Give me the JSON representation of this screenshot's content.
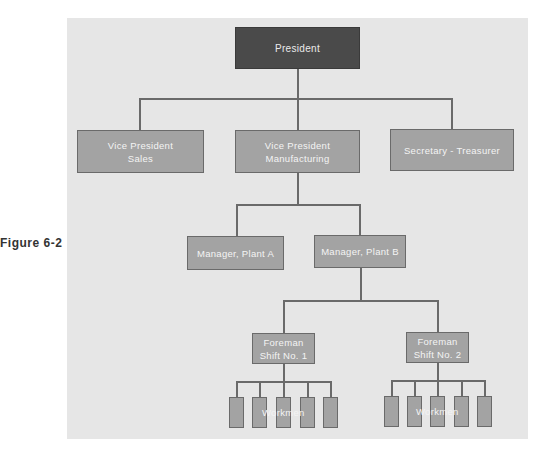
{
  "figure": {
    "label": "Figure 6-2"
  },
  "chart": {
    "nodes": {
      "president": {
        "lines": [
          "President"
        ]
      },
      "vp_sales": {
        "lines": [
          "Vice President",
          "Sales"
        ]
      },
      "vp_manufacturing": {
        "lines": [
          "Vice President",
          "Manufacturing"
        ]
      },
      "secretary_treasurer": {
        "lines": [
          "Secretary - Treasurer"
        ]
      },
      "manager_a": {
        "lines": [
          "Manager, Plant A"
        ]
      },
      "manager_b": {
        "lines": [
          "Manager, Plant B"
        ]
      },
      "foreman_1": {
        "lines": [
          "Foreman",
          "Shift No. 1"
        ]
      },
      "foreman_2": {
        "lines": [
          "Foreman",
          "Shift No. 2"
        ]
      },
      "workmen_1": {
        "label": "Workmen",
        "count": 5
      },
      "workmen_2": {
        "label": "Workmen",
        "count": 5
      }
    },
    "hierarchy": [
      {
        "parent": "President",
        "children": [
          "Vice President Sales",
          "Vice President Manufacturing",
          "Secretary - Treasurer"
        ]
      },
      {
        "parent": "Vice President Manufacturing",
        "children": [
          "Manager, Plant A",
          "Manager, Plant B"
        ]
      },
      {
        "parent": "Manager, Plant B",
        "children": [
          "Foreman Shift No. 1",
          "Foreman Shift No. 2"
        ]
      },
      {
        "parent": "Foreman Shift No. 1",
        "children": [
          "Workmen x5"
        ]
      },
      {
        "parent": "Foreman Shift No. 2",
        "children": [
          "Workmen x5"
        ]
      }
    ]
  },
  "colors": {
    "panel": "#e6e6e6",
    "president_box": "#4a4a4a",
    "box": "#a3a3a3",
    "line": "#6a6a6a",
    "box_text": "#f4f4f4"
  }
}
